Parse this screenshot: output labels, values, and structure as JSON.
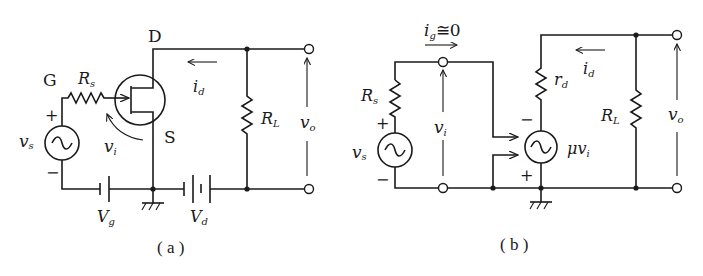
{
  "figure": {
    "panels": [
      {
        "id": "a",
        "caption": "( a )",
        "title": "JFET common-source amplifier circuit",
        "labels": {
          "drain": "D",
          "gate": "G",
          "source": "S",
          "rs_main": "R",
          "rs_sub": "s",
          "rl_main": "R",
          "rl_sub": "L",
          "vs_main": "v",
          "vs_sub": "s",
          "vi_main": "v",
          "vi_sub": "i",
          "vo_main": "v",
          "vo_sub": "o",
          "id_main": "i",
          "id_sub": "d",
          "vg_main": "V",
          "vg_sub": "g",
          "vd_main": "V",
          "vd_sub": "d",
          "plus": "+",
          "minus": "−"
        },
        "components": [
          "JFET (n-channel)",
          "Rs",
          "vs AC source",
          "Vg battery",
          "Vd battery",
          "RL",
          "ground",
          "output terminals"
        ]
      },
      {
        "id": "b",
        "caption": "( b )",
        "title": "Small-signal equivalent circuit",
        "labels": {
          "ig_main": "i",
          "ig_sub": "g",
          "ig_rest": "≅0",
          "rs_main": "R",
          "rs_sub": "s",
          "rd_main": "r",
          "rd_sub": "d",
          "rl_main": "R",
          "rl_sub": "L",
          "vs_main": "v",
          "vs_sub": "s",
          "vi_main": "v",
          "vi_sub": "i",
          "vo_main": "v",
          "vo_sub": "o",
          "id_main": "i",
          "id_sub": "d",
          "mu_main": "μv",
          "mu_sub": "i",
          "plus": "+",
          "minus": "−"
        },
        "components": [
          "Rs",
          "vs AC source",
          "input terminals",
          "dependent voltage source μvi",
          "rd",
          "RL",
          "ground",
          "output terminals"
        ]
      }
    ]
  }
}
